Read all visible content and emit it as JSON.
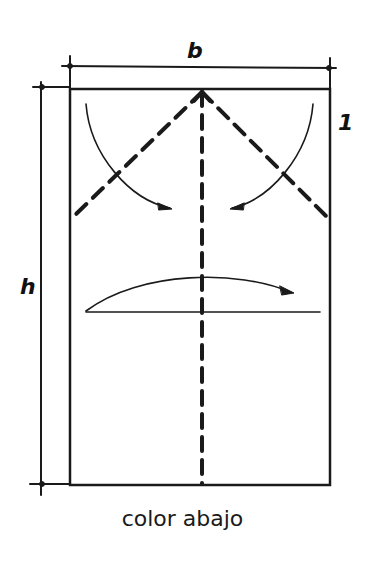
{
  "diagram": {
    "caption": "color abajo",
    "labels": {
      "width": "b",
      "height": "h",
      "marker": "1"
    },
    "colors": {
      "stroke": "#1a1a1a",
      "background": "#ffffff"
    }
  }
}
